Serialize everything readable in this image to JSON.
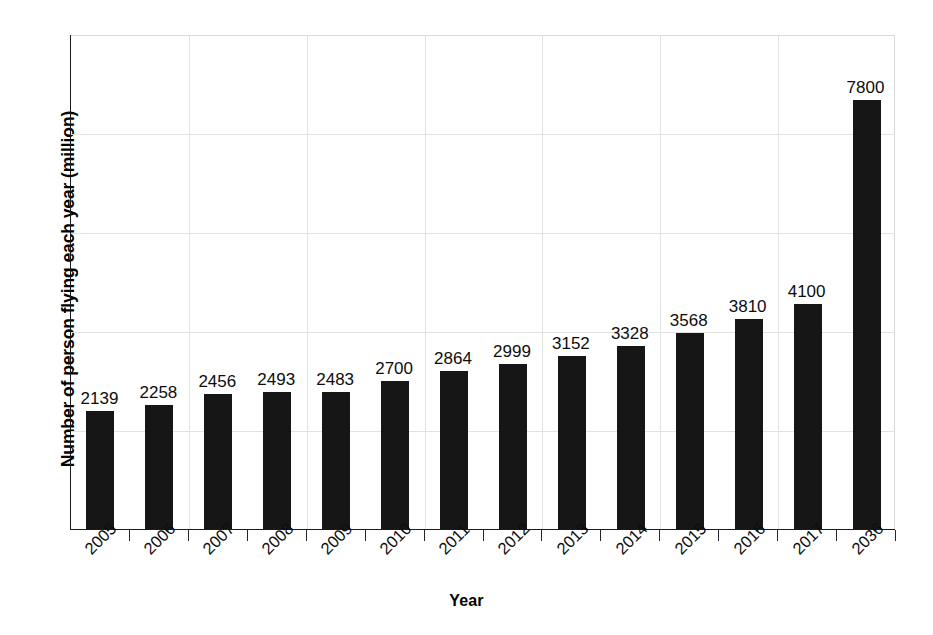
{
  "chart_data": {
    "type": "bar",
    "title": "",
    "xlabel": "Year",
    "ylabel": "Number of person flying each year (million)",
    "categories": [
      "2005",
      "2006",
      "2007",
      "2008",
      "2009",
      "2010",
      "2011",
      "2012",
      "2013",
      "2014",
      "2015",
      "2016",
      "2017",
      "2036"
    ],
    "values": [
      2139,
      2258,
      2456,
      2493,
      2483,
      2700,
      2864,
      2999,
      3152,
      3328,
      3568,
      3810,
      4100,
      7800
    ],
    "value_labels": [
      "2139",
      "2258",
      "2456",
      "2493",
      "2483",
      "2700",
      "2864",
      "2999",
      "3152",
      "3328",
      "3568",
      "3810",
      "4100",
      "7800"
    ],
    "ylim": [
      0,
      9000
    ],
    "xlim_note": "categorical",
    "grid": true,
    "grid_color": "#e2e2e2",
    "bar_color": "#161616",
    "axis_color": "#1a1a1a",
    "legend": null,
    "legend_position": "none",
    "y_tick_labels": [],
    "series": [
      {
        "name": "Number of person flying each year (million)",
        "values": [
          2139,
          2258,
          2456,
          2493,
          2483,
          2700,
          2864,
          2999,
          3152,
          3328,
          3568,
          3810,
          4100,
          7800
        ]
      }
    ]
  },
  "axes": {
    "x_title": "Year",
    "y_title": "Number of person flying each year (million)"
  }
}
